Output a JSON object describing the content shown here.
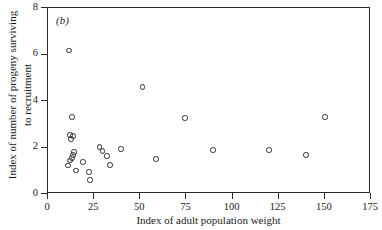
{
  "figure": {
    "panel_label": "(b)"
  },
  "chart_data": {
    "type": "scatter",
    "title": "",
    "panel": "(b)",
    "xlabel": "Index of adult population weight",
    "ylabel": "Index of number of progeny surviving to recruitment",
    "ylabel_lines": [
      "Index of number of progeny surviving",
      "to recruitment"
    ],
    "xlim": [
      0,
      175
    ],
    "ylim": [
      0,
      8
    ],
    "xticks": [
      0,
      25,
      50,
      75,
      100,
      125,
      150,
      175
    ],
    "xticklabels": [
      "0",
      "25",
      "50",
      "75",
      "100",
      "125",
      "150",
      "175"
    ],
    "yticks": [
      0,
      2,
      4,
      6,
      8
    ],
    "yticklabels": [
      "0",
      "2",
      "4",
      "6",
      "8"
    ],
    "grid": false,
    "legend": null,
    "marker": "open-circle",
    "marker_color": "#2a2a2a",
    "points": [
      {
        "x": 11.9,
        "y": 6.12
      },
      {
        "x": 13.5,
        "y": 3.27
      },
      {
        "x": 12.4,
        "y": 2.5
      },
      {
        "x": 14.1,
        "y": 2.45
      },
      {
        "x": 13.0,
        "y": 2.33
      },
      {
        "x": 14.6,
        "y": 1.76
      },
      {
        "x": 14.1,
        "y": 1.63
      },
      {
        "x": 13.5,
        "y": 1.5
      },
      {
        "x": 12.4,
        "y": 1.4
      },
      {
        "x": 11.4,
        "y": 1.18
      },
      {
        "x": 15.7,
        "y": 0.97
      },
      {
        "x": 19.5,
        "y": 1.33
      },
      {
        "x": 22.8,
        "y": 0.9
      },
      {
        "x": 23.3,
        "y": 0.56
      },
      {
        "x": 28.3,
        "y": 1.98
      },
      {
        "x": 29.9,
        "y": 1.81
      },
      {
        "x": 32.6,
        "y": 1.59
      },
      {
        "x": 34.1,
        "y": 1.2
      },
      {
        "x": 40.1,
        "y": 1.89
      },
      {
        "x": 51.9,
        "y": 4.56
      },
      {
        "x": 59.0,
        "y": 1.46
      },
      {
        "x": 74.8,
        "y": 3.23
      },
      {
        "x": 89.9,
        "y": 1.85
      },
      {
        "x": 120.2,
        "y": 1.85
      },
      {
        "x": 140.3,
        "y": 1.63
      },
      {
        "x": 150.6,
        "y": 3.27
      }
    ]
  }
}
